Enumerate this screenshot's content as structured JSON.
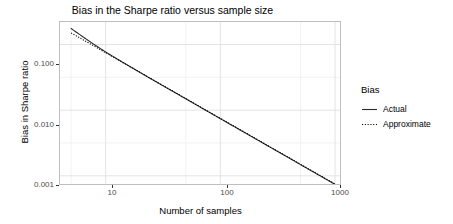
{
  "chart_data": {
    "type": "line",
    "title": "Bias in the Sharpe ratio versus sample size",
    "xlabel": "Number of samples",
    "ylabel": "Bias in Sharpe ratio",
    "xscale": "log",
    "yscale": "log",
    "xlim": [
      4,
      1150
    ],
    "ylim": [
      0.0007,
      0.22
    ],
    "grid": true,
    "grid_major_color": "#e0e0e0",
    "grid_minor_color": "#f0f0f0",
    "panel_border_color": "#bebebe",
    "line_color": "#2b2b2b",
    "legend": {
      "title": "Bias",
      "position": "right",
      "entries": [
        {
          "label": "Actual",
          "linestyle": "solid"
        },
        {
          "label": "Approximate",
          "linestyle": "dotted"
        }
      ]
    },
    "xticks": [
      10,
      100,
      1000
    ],
    "xtick_labels": [
      "10",
      "100",
      "1000"
    ],
    "yticks": [
      0.1,
      0.01,
      0.001
    ],
    "ytick_labels": [
      "0.100",
      "0.010",
      "0.001"
    ],
    "series": [
      {
        "name": "Actual",
        "linestyle": "solid",
        "x": [
          5,
          6,
          7,
          8,
          9,
          10,
          12,
          15,
          20,
          25,
          30,
          40,
          50,
          70,
          100,
          150,
          200,
          300,
          400,
          500,
          700,
          1000
        ],
        "y": [
          0.175,
          0.14,
          0.116,
          0.0992,
          0.0866,
          0.0769,
          0.0633,
          0.0502,
          0.0374,
          0.0298,
          0.0248,
          0.0186,
          0.0149,
          0.0106,
          0.00742,
          0.00495,
          0.00371,
          0.00247,
          0.00186,
          0.00148,
          0.00106,
          0.00074
        ]
      },
      {
        "name": "Approximate",
        "linestyle": "dotted",
        "x": [
          5,
          6,
          7,
          8,
          9,
          10,
          12,
          15,
          20,
          25,
          30,
          40,
          50,
          70,
          100,
          150,
          200,
          300,
          400,
          500,
          700,
          1000
        ],
        "y": [
          0.15,
          0.125,
          0.1071,
          0.0938,
          0.0833,
          0.075,
          0.0625,
          0.05,
          0.0375,
          0.03,
          0.025,
          0.0188,
          0.015,
          0.0107,
          0.0075,
          0.005,
          0.00375,
          0.0025,
          0.00188,
          0.0015,
          0.00107,
          0.00075
        ]
      }
    ],
    "annotation": "Approximate curve (3/(4n)) lies essentially on top of the Actual curve, rendered as a dotted overlay."
  }
}
